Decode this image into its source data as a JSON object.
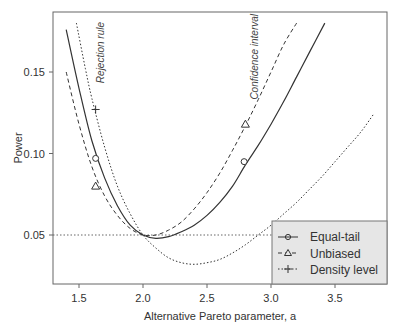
{
  "chart_data": {
    "type": "line",
    "title": "",
    "xlabel": "Alternative Pareto parameter, a",
    "ylabel": "Power",
    "xlim": [
      1.3,
      3.85
    ],
    "ylim": [
      0.02,
      0.18
    ],
    "x_ticks": [
      1.5,
      2.0,
      2.5,
      3.0,
      3.5
    ],
    "x_tick_labels": [
      "1.5",
      "2.0",
      "2.5",
      "3.0",
      "3.5"
    ],
    "y_ticks": [
      0.05,
      0.1,
      0.15
    ],
    "y_tick_labels": [
      "0.05",
      "0.10",
      "0.15"
    ],
    "grid": false,
    "legend_position": "bottom-right",
    "reference_line": {
      "y": 0.05,
      "style": "dotted"
    },
    "annotations": [
      {
        "text": "Rejection rule",
        "x": 1.68,
        "y": 0.165,
        "rotation": -90
      },
      {
        "text": "Confidence interval",
        "x": 2.86,
        "y": 0.16,
        "rotation": -90
      }
    ],
    "series": [
      {
        "name": "Equal-tail",
        "style": "solid",
        "marker": "circle",
        "x": [
          1.4,
          1.5,
          1.6,
          1.7,
          1.8,
          1.9,
          2.0,
          2.1,
          2.2,
          2.3,
          2.4,
          2.5,
          2.6,
          2.7,
          2.8,
          2.9,
          3.0,
          3.1,
          3.2,
          3.3,
          3.42
        ],
        "y": [
          0.176,
          0.14,
          0.108,
          0.085,
          0.068,
          0.056,
          0.05,
          0.048,
          0.049,
          0.052,
          0.056,
          0.062,
          0.07,
          0.08,
          0.093,
          0.105,
          0.118,
          0.132,
          0.147,
          0.162,
          0.18
        ],
        "markers_at": [
          [
            1.63,
            0.097
          ],
          [
            2.79,
            0.095
          ]
        ]
      },
      {
        "name": "Unbiased",
        "style": "dashed",
        "marker": "triangle",
        "x": [
          1.4,
          1.5,
          1.6,
          1.7,
          1.8,
          1.9,
          2.0,
          2.1,
          2.2,
          2.3,
          2.4,
          2.5,
          2.6,
          2.7,
          2.8,
          2.9,
          3.0,
          3.1,
          3.2
        ],
        "y": [
          0.15,
          0.118,
          0.092,
          0.074,
          0.062,
          0.054,
          0.05,
          0.05,
          0.053,
          0.058,
          0.066,
          0.076,
          0.088,
          0.102,
          0.117,
          0.133,
          0.15,
          0.167,
          0.18
        ],
        "markers_at": [
          [
            1.63,
            0.08
          ],
          [
            2.8,
            0.118
          ]
        ]
      },
      {
        "name": "Density level",
        "style": "dotted",
        "marker": "plus",
        "x": [
          1.48,
          1.55,
          1.6,
          1.7,
          1.8,
          1.9,
          2.0,
          2.1,
          2.2,
          2.3,
          2.4,
          2.5,
          2.6,
          2.7,
          2.8,
          2.9,
          3.0,
          3.1,
          3.2,
          3.3,
          3.4,
          3.5,
          3.6,
          3.7,
          3.8
        ],
        "y": [
          0.18,
          0.152,
          0.134,
          0.104,
          0.08,
          0.063,
          0.05,
          0.042,
          0.036,
          0.033,
          0.032,
          0.033,
          0.035,
          0.039,
          0.044,
          0.05,
          0.056,
          0.063,
          0.07,
          0.078,
          0.086,
          0.095,
          0.104,
          0.113,
          0.124
        ],
        "markers_at": [
          [
            1.63,
            0.127
          ]
        ]
      }
    ]
  },
  "legend": {
    "items": [
      {
        "label": "Equal-tail",
        "marker": "circle",
        "style": "solid"
      },
      {
        "label": "Unbiased",
        "marker": "triangle",
        "style": "dashed"
      },
      {
        "label": "Density level",
        "marker": "plus",
        "style": "dotted"
      }
    ],
    "background": "#e6e6e6"
  },
  "colors": {
    "line": "#333333",
    "frame": "#555555",
    "legend_bg": "#e6e6e6"
  }
}
